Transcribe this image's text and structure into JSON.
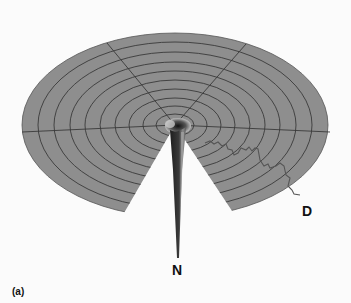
{
  "figure": {
    "panel_label": "(a)",
    "labels": {
      "spike": "N",
      "curve": "D"
    },
    "colors": {
      "surface": "#8c8c8c",
      "grid_lines": "#3a3a3a",
      "spike_dark": "#2a2a2a",
      "spike_light": "#9a9a9a",
      "background": "#fbfbfb"
    },
    "rings": 9,
    "radial_lines": 4
  }
}
